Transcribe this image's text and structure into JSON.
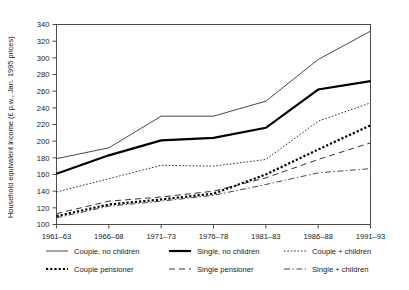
{
  "chart_data": {
    "type": "line",
    "title": "",
    "xlabel": "",
    "ylabel": "Household equivalent income (£ p.w., Jan. 1995 prices)",
    "categories": [
      "1961–63",
      "1966–68",
      "1971–73",
      "1976–78",
      "1981–83",
      "1986–88",
      "1991–93"
    ],
    "ylim": [
      100,
      340
    ],
    "yticks": [
      100,
      120,
      140,
      160,
      180,
      200,
      220,
      240,
      260,
      280,
      300,
      320,
      340
    ],
    "grid": false,
    "legend_position": "bottom",
    "series": [
      {
        "name": "Couple, no children",
        "style": "solid-thin",
        "color": "#333333",
        "values": [
          179,
          192,
          230,
          230,
          248,
          298,
          332
        ]
      },
      {
        "name": "Single, no children",
        "style": "solid-thick",
        "color": "#000000",
        "values": [
          161,
          183,
          201,
          204,
          216,
          262,
          272
        ]
      },
      {
        "name": "Couple + children",
        "style": "dotted-fine",
        "color": "#333333",
        "values": [
          139,
          155,
          171,
          170,
          178,
          224,
          246
        ]
      },
      {
        "name": "Couple pensioner",
        "style": "dotted-heavy",
        "color": "#000000",
        "values": [
          110,
          124,
          130,
          137,
          160,
          190,
          219
        ]
      },
      {
        "name": "Single pensioner",
        "style": "dashed",
        "color": "#333333",
        "values": [
          113,
          128,
          133,
          140,
          156,
          178,
          198
        ]
      },
      {
        "name": "Single + children",
        "style": "dash-dot",
        "color": "#333333",
        "values": [
          108,
          122,
          128,
          135,
          148,
          162,
          167
        ]
      }
    ]
  },
  "legend": {
    "entries": [
      {
        "label": "Couple, no children",
        "style": "solid-thin"
      },
      {
        "label": "Single, no children",
        "style": "solid-thick"
      },
      {
        "label": "Couple + children",
        "style": "dotted-fine"
      },
      {
        "label": "Couple pensioner",
        "style": "dotted-heavy"
      },
      {
        "label": "Single pensioner",
        "style": "dashed"
      },
      {
        "label": "Single + children",
        "style": "dash-dot"
      }
    ]
  }
}
